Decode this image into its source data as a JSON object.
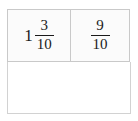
{
  "widget": {
    "type": "fraction-worksheet",
    "cells": [
      {
        "name": "first-operand",
        "whole": "1",
        "numerator": "3",
        "denominator": "10",
        "display": "1 3/10"
      },
      {
        "name": "second-operand",
        "whole": "",
        "numerator": "9",
        "denominator": "10",
        "display": "9/10"
      }
    ],
    "answer_box": {
      "name": "answer-area",
      "value": "",
      "placeholder": ""
    },
    "colors": {
      "cell_background": "#fbfbfb",
      "cell_border": "#c9c9c9",
      "answer_background": "#ffffff",
      "answer_border": "#d2d2d2",
      "text": "#1a1a1a"
    }
  }
}
